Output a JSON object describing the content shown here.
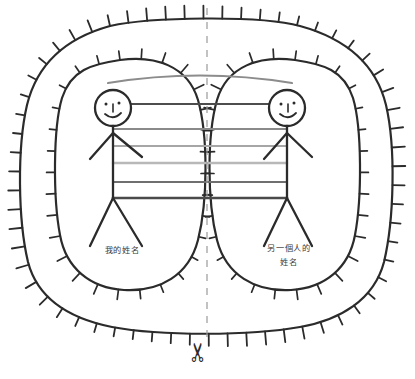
{
  "page": {
    "background_color": "#ffffff",
    "width": 415,
    "height": 379
  },
  "diagram": {
    "type": "hand-drawn-sketch",
    "ink_color": "#2b2b2b",
    "outer_boundary": {
      "name": "outer-spiky-boundary",
      "shape": "rounded-rectangle-blob",
      "spikes": 62,
      "spike_direction": "outward",
      "stroke": "#2b2b2b",
      "stroke_width": 2.2
    },
    "inner_boundaries": [
      {
        "name": "left-spiky-oval",
        "side": "left",
        "spikes": 30,
        "spike_direction": "outward",
        "stroke": "#2b2b2b",
        "stroke_width": 2.2
      },
      {
        "name": "right-spiky-oval",
        "side": "right",
        "spikes": 30,
        "spike_direction": "outward",
        "stroke": "#2b2b2b",
        "stroke_width": 2.2
      }
    ],
    "figures": [
      {
        "name": "left-stick-figure",
        "side": "left",
        "face": "smiley",
        "label": "我的姓名",
        "label_lines": [
          "我的姓名"
        ],
        "label_meaning": "My name",
        "stroke": "#2b2b2b"
      },
      {
        "name": "right-stick-figure",
        "side": "right",
        "face": "smiley",
        "label": "另一個人的姓名",
        "label_lines": [
          "另一個人的",
          "姓名"
        ],
        "label_meaning": "The other person's name",
        "stroke": "#2b2b2b"
      }
    ],
    "connecting_lines": [
      {
        "index": 1,
        "name": "connection-line-1",
        "color": "#8c8c8c",
        "width": 2.1,
        "curved": true,
        "y": 77
      },
      {
        "index": 2,
        "name": "connection-line-2",
        "color": "#4d4d4d",
        "width": 2.1,
        "curved": false,
        "y": 104
      },
      {
        "index": 3,
        "name": "connection-line-3",
        "color": "#8a8a8a",
        "width": 2.1,
        "curved": false,
        "y": 129
      },
      {
        "index": 4,
        "name": "connection-line-4",
        "color": "#a6a6a6",
        "width": 2.1,
        "curved": false,
        "y": 146
      },
      {
        "index": 5,
        "name": "connection-line-5",
        "color": "#b8b8b8",
        "width": 2.4,
        "curved": false,
        "y": 163
      },
      {
        "index": 6,
        "name": "connection-line-6",
        "color": "#6f6f6f",
        "width": 2.1,
        "curved": false,
        "y": 182
      },
      {
        "index": 7,
        "name": "connection-line-7",
        "color": "#4a4a4a",
        "width": 2.6,
        "curved": false,
        "y": 198
      }
    ],
    "cut_line": {
      "name": "dashed-cut-line",
      "orientation": "vertical",
      "x": 207,
      "color": "#9a9a9a",
      "dash": "7 7",
      "width": 1.2
    },
    "scissors": {
      "name": "scissors-icon",
      "glyph": "✂",
      "color": "#2b2b2b",
      "x": 207,
      "y": 352,
      "rotation_deg": -90
    }
  }
}
